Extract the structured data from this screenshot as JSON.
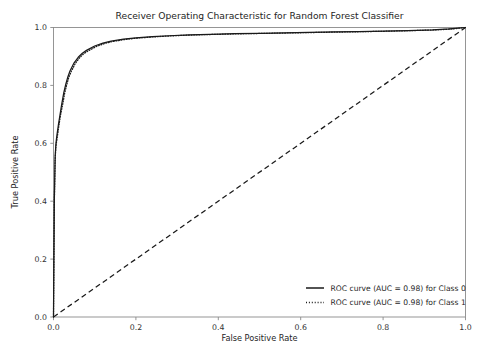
{
  "chart_data": {
    "type": "line",
    "title": "Receiver Operating Characteristic for Random Forest Classifier",
    "xlabel": "False Positive Rate",
    "ylabel": "True Positive Rate",
    "xlim": [
      0.0,
      1.0
    ],
    "ylim": [
      0.0,
      1.0
    ],
    "xticks": [
      "0.0",
      "0.2",
      "0.4",
      "0.6",
      "0.8",
      "1.0"
    ],
    "xtick_values": [
      0.0,
      0.2,
      0.4,
      0.6,
      0.8,
      1.0
    ],
    "yticks": [
      "0.0",
      "0.2",
      "0.4",
      "0.6",
      "0.8",
      "1.0"
    ],
    "ytick_values": [
      0.0,
      0.2,
      0.4,
      0.6,
      0.8,
      1.0
    ],
    "grid": false,
    "legend_position": "lower right",
    "legend_frame": false,
    "line_color": "#1a1a1a",
    "series": [
      {
        "name": "ROC curve (AUC = 0.98) for Class 0",
        "auc": 0.98,
        "style": "solid",
        "x": [
          0.0,
          0.002,
          0.004,
          0.006,
          0.008,
          0.012,
          0.016,
          0.02,
          0.025,
          0.03,
          0.035,
          0.04,
          0.05,
          0.06,
          0.07,
          0.08,
          0.1,
          0.12,
          0.14,
          0.17,
          0.2,
          0.24,
          0.28,
          0.33,
          0.38,
          0.44,
          0.5,
          0.56,
          0.62,
          0.68,
          0.74,
          0.8,
          0.86,
          0.92,
          0.96,
          1.0
        ],
        "y": [
          0.0,
          0.4,
          0.555,
          0.6,
          0.625,
          0.665,
          0.7,
          0.735,
          0.775,
          0.805,
          0.83,
          0.85,
          0.878,
          0.897,
          0.911,
          0.921,
          0.936,
          0.946,
          0.953,
          0.96,
          0.9645,
          0.9685,
          0.9715,
          0.9745,
          0.9765,
          0.9785,
          0.98,
          0.9815,
          0.983,
          0.9845,
          0.986,
          0.9875,
          0.9895,
          0.992,
          0.995,
          1.0
        ]
      },
      {
        "name": "ROC curve (AUC = 0.98) for Class 1",
        "auc": 0.98,
        "style": "dotted",
        "x": [
          0.0,
          0.002,
          0.004,
          0.006,
          0.009,
          0.013,
          0.017,
          0.022,
          0.027,
          0.032,
          0.037,
          0.043,
          0.053,
          0.063,
          0.073,
          0.085,
          0.105,
          0.125,
          0.145,
          0.175,
          0.205,
          0.245,
          0.285,
          0.335,
          0.385,
          0.445,
          0.505,
          0.565,
          0.625,
          0.685,
          0.745,
          0.805,
          0.865,
          0.925,
          0.965,
          1.0
        ],
        "y": [
          0.0,
          0.395,
          0.545,
          0.592,
          0.62,
          0.66,
          0.697,
          0.732,
          0.772,
          0.802,
          0.827,
          0.848,
          0.876,
          0.895,
          0.909,
          0.92,
          0.935,
          0.945,
          0.952,
          0.959,
          0.9635,
          0.9678,
          0.971,
          0.974,
          0.976,
          0.978,
          0.9795,
          0.981,
          0.9825,
          0.984,
          0.9855,
          0.987,
          0.989,
          0.9915,
          0.9945,
          1.0
        ]
      }
    ],
    "reference_line": {
      "name": "chance-diagonal",
      "style": "dashed",
      "x": [
        0.0,
        1.0
      ],
      "y": [
        0.0,
        1.0
      ]
    }
  },
  "legend": {
    "items": [
      {
        "label": "ROC curve (AUC = 0.98) for Class 0",
        "style": "solid"
      },
      {
        "label": "ROC curve (AUC = 0.98) for Class 1",
        "style": "dotted"
      }
    ]
  }
}
